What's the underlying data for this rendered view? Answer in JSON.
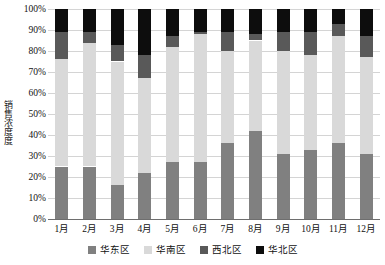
{
  "chart_data": {
    "type": "bar",
    "stacked": true,
    "stack_mode": "percent",
    "title": "",
    "xlabel": "",
    "ylabel": "销售浓度度",
    "ylim": [
      0,
      100
    ],
    "ytick_labels": [
      "0%",
      "10%",
      "20%",
      "30%",
      "40%",
      "50%",
      "60%",
      "70%",
      "80%",
      "90%",
      "100%"
    ],
    "ytick_values": [
      0,
      10,
      20,
      30,
      40,
      50,
      60,
      70,
      80,
      90,
      100
    ],
    "grid": true,
    "legend_position": "bottom",
    "categories": [
      "1月",
      "2月",
      "3月",
      "4月",
      "5月",
      "6月",
      "7月",
      "8月",
      "9月",
      "10月",
      "11月",
      "12月"
    ],
    "series": [
      {
        "name": "华东区",
        "color": "#808080",
        "values": [
          25,
          25,
          16,
          22,
          27,
          27,
          36,
          42,
          31,
          33,
          36,
          31
        ]
      },
      {
        "name": "华南区",
        "color": "#d9d9d9",
        "values": [
          51,
          59,
          59,
          45,
          55,
          61,
          44,
          43,
          49,
          45,
          51,
          46
        ]
      },
      {
        "name": "西北区",
        "color": "#595959",
        "values": [
          13,
          5,
          8,
          11,
          5,
          1,
          9,
          3,
          9,
          11,
          6,
          10
        ]
      },
      {
        "name": "华北区",
        "color": "#0d0d0d",
        "values": [
          11,
          11,
          17,
          22,
          13,
          11,
          11,
          12,
          11,
          11,
          7,
          13
        ]
      }
    ]
  }
}
